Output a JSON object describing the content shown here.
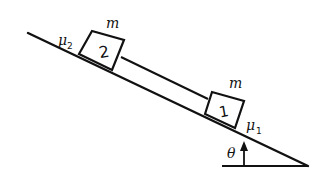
{
  "diagram": {
    "type": "incline-two-blocks",
    "incline": {
      "angle_label": "θ"
    },
    "blocks": [
      {
        "id": "2",
        "label": "2",
        "mass_label": "m",
        "friction_label": "μ",
        "friction_sub": "2"
      },
      {
        "id": "1",
        "label": "1",
        "mass_label": "m",
        "friction_label": "μ",
        "friction_sub": "1"
      }
    ],
    "connector": "rod",
    "colors": {
      "ink": "#111111",
      "background": "#ffffff"
    }
  }
}
